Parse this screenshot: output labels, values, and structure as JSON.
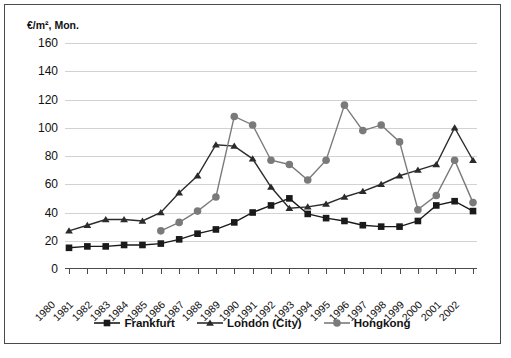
{
  "chart_data": {
    "type": "line",
    "title": "",
    "ylabel": "€/m², Mon.",
    "xlabel": "",
    "ylim": [
      0,
      160
    ],
    "yticks": [
      0,
      20,
      40,
      60,
      80,
      100,
      120,
      140,
      160
    ],
    "grid": true,
    "legend_position": "bottom",
    "categories": [
      "1980",
      "1981",
      "1982",
      "1983",
      "1984",
      "1985",
      "1986",
      "1987",
      "1988",
      "1989",
      "1990",
      "1991",
      "1992",
      "1993",
      "1994",
      "1995",
      "1996",
      "1997",
      "1998",
      "1999",
      "2000",
      "2001",
      "2002"
    ],
    "series": [
      {
        "name": "Frankfurt",
        "marker": "square",
        "color": "#1a1a1a",
        "values": [
          15,
          16,
          16,
          17,
          17,
          18,
          21,
          25,
          28,
          33,
          40,
          45,
          50,
          39,
          36,
          34,
          31,
          30,
          30,
          34,
          45,
          48,
          41
        ]
      },
      {
        "name": "London (City)",
        "marker": "triangle",
        "color": "#2b2b2b",
        "values": [
          27,
          31,
          35,
          35,
          34,
          40,
          54,
          66,
          88,
          87,
          78,
          58,
          43,
          44,
          46,
          51,
          55,
          60,
          66,
          70,
          74,
          100,
          77
        ]
      },
      {
        "name": "Hongkong",
        "marker": "circle",
        "color": "#7a7a7a",
        "values": [
          null,
          null,
          null,
          null,
          null,
          27,
          33,
          41,
          51,
          108,
          102,
          77,
          74,
          63,
          77,
          116,
          98,
          102,
          90,
          42,
          52,
          77,
          47
        ]
      }
    ]
  },
  "legend": {
    "items": [
      {
        "label": "Frankfurt",
        "marker": "square",
        "color": "#1a1a1a"
      },
      {
        "label": "London (City)",
        "marker": "triangle",
        "color": "#2b2b2b"
      },
      {
        "label": "Hongkong",
        "marker": "circle",
        "color": "#7a7a7a"
      }
    ]
  }
}
